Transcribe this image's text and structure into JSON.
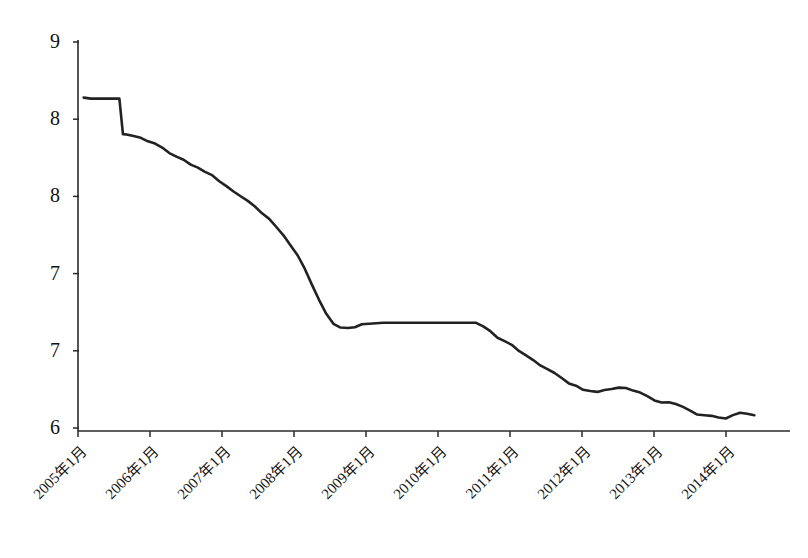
{
  "chart_data": {
    "type": "line",
    "title": "",
    "subtitle": "",
    "xlabel": "",
    "ylabel": "",
    "grid": false,
    "legend": "none",
    "ylim": [
      6.0,
      9.0
    ],
    "y_ticks": [
      9.0,
      8.5,
      8.0,
      7.5,
      7.0,
      6.0
    ],
    "y_tick_labels": [
      "9",
      "8",
      "8",
      "7",
      "7",
      "6"
    ],
    "x_tick_labels": [
      "2005年1月",
      "2006年1月",
      "2007年1月",
      "2008年1月",
      "2009年1月",
      "2010年1月",
      "2011年1月",
      "2012年1月",
      "2013年1月",
      "2014年1月"
    ],
    "x": [
      2005.0,
      2005.1,
      2005.2,
      2005.3,
      2005.4,
      2005.5,
      2005.55,
      2005.6,
      2005.7,
      2005.8,
      2005.9,
      2006.0,
      2006.1,
      2006.2,
      2006.3,
      2006.4,
      2006.5,
      2006.6,
      2006.7,
      2006.8,
      2006.9,
      2007.0,
      2007.1,
      2007.2,
      2007.3,
      2007.4,
      2007.5,
      2007.6,
      2007.7,
      2007.8,
      2007.9,
      2008.0,
      2008.1,
      2008.2,
      2008.3,
      2008.4,
      2008.5,
      2008.6,
      2008.7,
      2008.8,
      2008.9,
      2009.0,
      2009.2,
      2009.4,
      2009.6,
      2009.8,
      2010.0,
      2010.2,
      2010.4,
      2010.5,
      2010.6,
      2010.7,
      2010.8,
      2010.9,
      2011.0,
      2011.1,
      2011.2,
      2011.3,
      2011.4,
      2011.5,
      2011.6,
      2011.7,
      2011.8,
      2011.9,
      2012.0,
      2012.1,
      2012.2,
      2012.3,
      2012.4,
      2012.5,
      2012.6,
      2012.7,
      2012.8,
      2012.9,
      2013.0,
      2013.1,
      2013.2,
      2013.3,
      2013.4,
      2013.5,
      2013.6,
      2013.7,
      2013.8,
      2013.9,
      2014.0,
      2014.1,
      2014.2,
      2014.3,
      2014.4
    ],
    "values": [
      8.55,
      8.55,
      8.55,
      8.55,
      8.55,
      8.55,
      8.28,
      8.27,
      8.26,
      8.25,
      8.23,
      8.21,
      8.17,
      8.14,
      8.11,
      8.08,
      8.05,
      8.02,
      7.99,
      7.96,
      7.92,
      7.88,
      7.84,
      7.8,
      7.76,
      7.72,
      7.67,
      7.62,
      7.56,
      7.5,
      7.43,
      7.35,
      7.24,
      7.12,
      7.0,
      6.9,
      6.83,
      6.8,
      6.79,
      6.8,
      6.82,
      6.83,
      6.83,
      6.83,
      6.83,
      6.83,
      6.83,
      6.83,
      6.83,
      6.83,
      6.8,
      6.76,
      6.72,
      6.69,
      6.66,
      6.62,
      6.58,
      6.54,
      6.5,
      6.47,
      6.44,
      6.4,
      6.37,
      6.34,
      6.31,
      6.3,
      6.3,
      6.31,
      6.32,
      6.33,
      6.33,
      6.31,
      6.29,
      6.26,
      6.23,
      6.22,
      6.22,
      6.21,
      6.18,
      6.15,
      6.13,
      6.12,
      6.11,
      6.1,
      6.09,
      6.12,
      6.14,
      6.13,
      6.12
    ],
    "axis_color": "#2a2a2a",
    "line_color": "#222222",
    "background_color": "#ffffff"
  },
  "plot": {
    "x_axis_min": 2004.92,
    "x_axis_max": 2014.9,
    "left_px": 78,
    "right_px": 790,
    "top_px": 40,
    "bottom_px": 431,
    "tick_start_px": 78,
    "tick_step_px": 72
  }
}
